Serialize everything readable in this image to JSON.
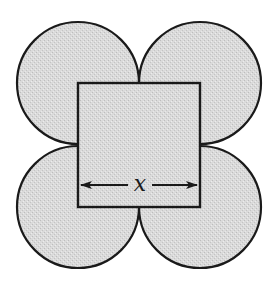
{
  "figure": {
    "square": {
      "x": 78,
      "y": 83,
      "side": 122
    },
    "circles": [
      {
        "name": "top-left",
        "cx": 78,
        "cy": 83,
        "r": 61
      },
      {
        "name": "top-right",
        "cx": 200,
        "cy": 83,
        "r": 61
      },
      {
        "name": "bottom-left",
        "cx": 78,
        "cy": 207,
        "r": 61
      },
      {
        "name": "bottom-right",
        "cx": 200,
        "cy": 207,
        "r": 61
      }
    ],
    "dimension": {
      "label": "x",
      "y": 185,
      "x_start": 80,
      "x_end": 198
    },
    "colors": {
      "fill": "#d6d6d6",
      "stroke": "#1a1a1a",
      "background": "#ffffff"
    }
  }
}
